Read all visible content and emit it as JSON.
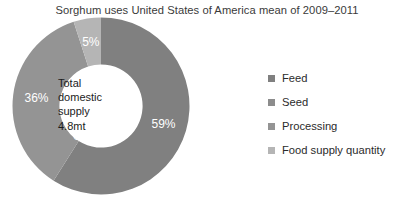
{
  "title": "Sorghum uses United States of America mean of 2009–2011",
  "center": {
    "line1": "Total",
    "line2": "domestic",
    "line3": "supply",
    "line4": "4.8mt"
  },
  "legend": {
    "items": [
      {
        "label": "Feed",
        "color": "#808080"
      },
      {
        "label": "Seed",
        "color": "#8c8c8c"
      },
      {
        "label": "Processing",
        "color": "#949494"
      },
      {
        "label": "Food supply quantity",
        "color": "#b5b5b5"
      }
    ]
  },
  "labels": {
    "feed": "59%",
    "seed": "0%",
    "processing": "36%",
    "food": "5%"
  },
  "chart_data": {
    "type": "pie",
    "title": "Sorghum uses United States of America mean of 2009–2011",
    "subtitle": "",
    "xlabel": "",
    "ylabel": "",
    "donut": true,
    "inner_radius_ratio": 0.47,
    "start_angle_deg": 0,
    "direction": "clockwise",
    "center_annotation": "Total domestic supply 4.8mt",
    "total_value": 4.8,
    "total_units": "mt",
    "legend_position": "right",
    "grid": false,
    "categories": [
      "Feed",
      "Seed",
      "Processing",
      "Food supply quantity"
    ],
    "values": [
      59,
      0,
      36,
      5
    ],
    "value_labels": [
      "59%",
      "0%",
      "36%",
      "5%"
    ],
    "colors": [
      "#808080",
      "#8c8c8c",
      "#949494",
      "#b5b5b5"
    ],
    "series": [
      {
        "name": "Share of total domestic supply (%)",
        "values": [
          59,
          0,
          36,
          5
        ]
      }
    ]
  }
}
